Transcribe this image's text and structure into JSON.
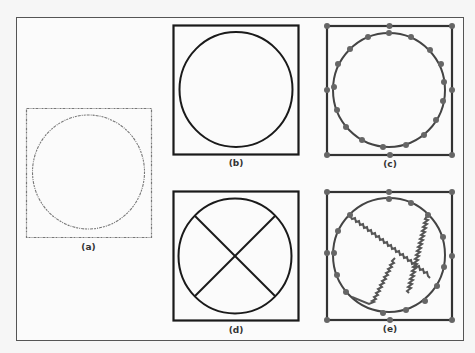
{
  "figure": {
    "panels": [
      {
        "id": "a",
        "label": "(a)",
        "description": "noisy dotted square with inscribed circle"
      },
      {
        "id": "b",
        "label": "(b)",
        "description": "clean square with inscribed circle"
      },
      {
        "id": "c",
        "label": "(c)",
        "description": "square and circle with vertex points"
      },
      {
        "id": "d",
        "label": "(d)",
        "description": "square with circle and diagonal cross"
      },
      {
        "id": "e",
        "label": "(e)",
        "description": "square, circle with vertex points and zigzag cross"
      }
    ],
    "colors": {
      "stroke": "#1a1a1a",
      "vertex": "#666666",
      "noisy": "#777777",
      "frame": "#555555"
    }
  }
}
